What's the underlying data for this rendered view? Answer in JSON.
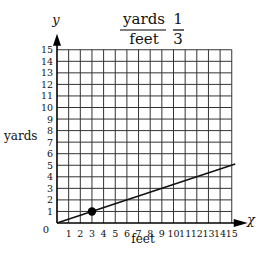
{
  "title": {
    "numerator": "yards",
    "denominator": "feet",
    "value_numerator": "1",
    "value_denominator": "3"
  },
  "chart_data": {
    "type": "line",
    "xlabel": "feet",
    "ylabel": "yards",
    "x_axis_symbol": "x",
    "y_axis_symbol": "y",
    "xlim": [
      0,
      15
    ],
    "ylim": [
      0,
      15
    ],
    "x_ticks": [
      0,
      1,
      2,
      3,
      4,
      5,
      6,
      7,
      8,
      9,
      10,
      11,
      12,
      13,
      14,
      15
    ],
    "y_ticks": [
      0,
      1,
      2,
      3,
      4,
      5,
      6,
      7,
      8,
      9,
      10,
      11,
      12,
      13,
      14,
      15
    ],
    "grid": true,
    "series": [
      {
        "name": "yards = feet/3",
        "x": [
          0,
          15.3
        ],
        "y": [
          0,
          5.1
        ]
      }
    ],
    "points": [
      {
        "x": 3,
        "y": 1
      }
    ]
  }
}
